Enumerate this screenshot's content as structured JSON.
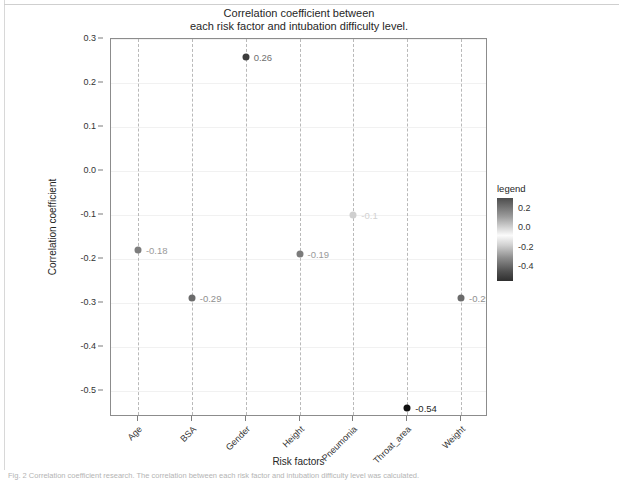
{
  "chart_data": {
    "type": "scatter",
    "title": "Correlation coefficient between\neach risk factor and intubation difficulty level.",
    "xlabel": "Risk factors",
    "ylabel": "Correlation coefficient",
    "categories": [
      "Age",
      "BSA",
      "Gender",
      "Height",
      "Pneumonia",
      "Throat_area",
      "Weight"
    ],
    "values": [
      -0.18,
      -0.29,
      0.26,
      -0.19,
      -0.1,
      -0.54,
      -0.29
    ],
    "point_labels": [
      "-0.18",
      "-0.29",
      "0.26",
      "-0.19",
      "-0.1",
      "-0.54",
      "-0.29"
    ],
    "point_colors": [
      "#7d7d7d",
      "#6b6b6b",
      "#3d3d3d",
      "#7b7b7b",
      "#cfcfcf",
      "#111111",
      "#6b6b6b"
    ],
    "label_colors": [
      "#9a9a9a",
      "#8f8f8f",
      "#6f6f6f",
      "#9a9a9a",
      "#d2d2d2",
      "#1f1f1f",
      "#8f8f8f"
    ],
    "ylim": [
      -0.56,
      0.3
    ],
    "yticks": [
      0.3,
      0.2,
      0.1,
      0.0,
      -0.1,
      -0.2,
      -0.3,
      -0.4,
      -0.5
    ],
    "ytick_labels": [
      "0.3",
      "0.2",
      "0.1",
      "0.0",
      "-0.1",
      "-0.2",
      "-0.3",
      "-0.4",
      "-0.5"
    ],
    "grid": "vertical dashed gridlines at each category",
    "legend": {
      "position": "right",
      "title": "legend",
      "type": "continuous-colorbar",
      "ticks": [
        0.2,
        0.0,
        -0.2,
        -0.4
      ],
      "tick_labels": [
        "0.2",
        "0.0",
        "-0.2",
        "-0.4"
      ],
      "range": [
        0.3,
        -0.55
      ]
    }
  },
  "figure": {
    "caption": "Fig. 2 Correlation coefficient research. The correlation between each risk factor and intubation difficulty level was calculated."
  }
}
